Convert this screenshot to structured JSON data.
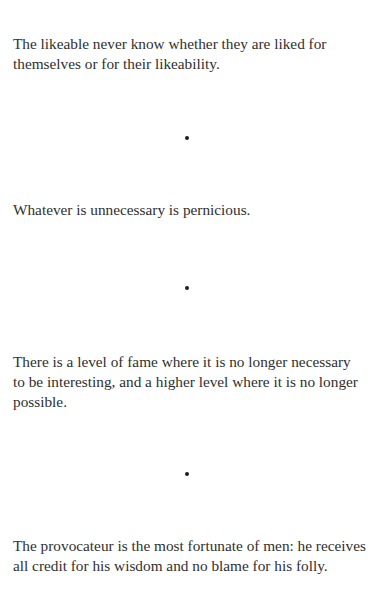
{
  "running_head": "Nothing",
  "quotes": [
    {
      "lines": [
        "The likeable never know whether they are liked for",
        "themselves or for their likeability."
      ]
    },
    {
      "lines": [
        "Whatever is unnecessary is pernicious."
      ]
    },
    {
      "lines": [
        "There is a level of fame where it is no longer necessary",
        "to be interesting, and a higher level where it is no longer",
        "possible."
      ]
    },
    {
      "lines": [
        "The provocateur is the most fortunate of men: he receives",
        "all credit for his wisdom and no blame for his folly."
      ]
    }
  ],
  "separator": {
    "icon": "bullet-dot-icon",
    "color": "#1e1e1e"
  },
  "text_color": "#2f2f2f"
}
